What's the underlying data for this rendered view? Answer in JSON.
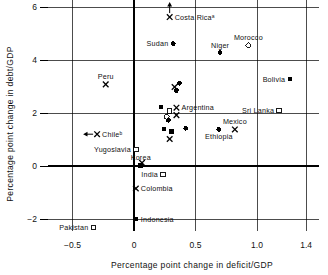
{
  "chart_data": {
    "type": "scatter",
    "title": "",
    "xlabel": "Percentage point change in deficit/GDP",
    "ylabel": "Percentage point change in debt/GDP",
    "xlim": [
      -0.7,
      1.5
    ],
    "ylim": [
      -2.45,
      6.35
    ],
    "xticks": [
      -0.5,
      0,
      0.5,
      1.0,
      1.4
    ],
    "xtick_labels": [
      "−0.5",
      "0",
      "0.5",
      "1.0",
      "1.4"
    ],
    "yticks": [
      -2,
      0,
      2,
      4,
      6
    ],
    "ytick_labels": [
      "−2",
      "0",
      "2",
      "4",
      "6"
    ],
    "grid": true,
    "legend": "none",
    "marker_types": {
      "filled-circle": "filled circle",
      "open-circle": "open circle",
      "filled-square": "filled square",
      "open-square": "open square",
      "cross": "x cross"
    },
    "points": [
      {
        "label": "Costa Ricaᵃ",
        "x": 0.29,
        "y": 5.62,
        "marker": "cross",
        "label_pos": "right",
        "arrow": "up"
      },
      {
        "label": "Sudan",
        "x": 0.32,
        "y": 4.62,
        "marker": "filled-circle",
        "label_pos": "left"
      },
      {
        "label": "Niger",
        "x": 0.7,
        "y": 4.28,
        "marker": "filled-circle",
        "label_pos": "above"
      },
      {
        "label": "Morocco",
        "x": 0.93,
        "y": 4.55,
        "marker": "open-circle",
        "label_pos": "above"
      },
      {
        "label": "Peru",
        "x": -0.23,
        "y": 3.08,
        "marker": "cross",
        "label_pos": "above"
      },
      {
        "label": "Bolivia",
        "x": 1.27,
        "y": 3.28,
        "marker": "filled-circle",
        "label_pos": "left"
      },
      {
        "label": "",
        "x": 0.37,
        "y": 3.12,
        "marker": "filled-circle",
        "label_pos": "none"
      },
      {
        "label": "",
        "x": 0.33,
        "y": 2.98,
        "marker": "cross",
        "label_pos": "none"
      },
      {
        "label": "",
        "x": 0.345,
        "y": 2.85,
        "marker": "filled-circle",
        "label_pos": "none"
      },
      {
        "label": "Argentina",
        "x": 0.345,
        "y": 2.2,
        "marker": "cross",
        "label_pos": "right"
      },
      {
        "label": "Sri Lanka",
        "x": 1.18,
        "y": 2.1,
        "marker": "open-square",
        "label_pos": "left"
      },
      {
        "label": "",
        "x": 0.22,
        "y": 2.22,
        "marker": "filled-square",
        "label_pos": "none"
      },
      {
        "label": "",
        "x": 0.29,
        "y": 2.08,
        "marker": "open-square",
        "label_pos": "none"
      },
      {
        "label": "",
        "x": 0.345,
        "y": 1.92,
        "marker": "cross",
        "label_pos": "none"
      },
      {
        "label": "",
        "x": 0.265,
        "y": 1.86,
        "marker": "open-circle",
        "label_pos": "none"
      },
      {
        "label": "",
        "x": 0.28,
        "y": 1.72,
        "marker": "filled-circle",
        "label_pos": "none"
      },
      {
        "label": "Mexico",
        "x": 0.82,
        "y": 1.38,
        "marker": "cross",
        "label_pos": "above"
      },
      {
        "label": "Ethiopia",
        "x": 0.69,
        "y": 1.38,
        "marker": "filled-circle",
        "label_pos": "below"
      },
      {
        "label": "",
        "x": 0.245,
        "y": 1.4,
        "marker": "filled-square",
        "label_pos": "none"
      },
      {
        "label": "",
        "x": 0.42,
        "y": 1.42,
        "marker": "filled-circle",
        "label_pos": "none"
      },
      {
        "label": "",
        "x": 0.305,
        "y": 1.3,
        "marker": "filled-square",
        "label_pos": "none"
      },
      {
        "label": "",
        "x": 0.29,
        "y": 1.02,
        "marker": "cross",
        "label_pos": "none"
      },
      {
        "label": "Chileᵇ",
        "x": -0.3,
        "y": 1.2,
        "marker": "cross",
        "label_pos": "right",
        "arrow": "left"
      },
      {
        "label": "Yugoslavia",
        "x": 0.015,
        "y": 0.62,
        "marker": "open-square",
        "label_pos": "left"
      },
      {
        "label": "Korea",
        "x": 0.055,
        "y": 0.02,
        "marker": "filled-square",
        "label_pos": "above"
      },
      {
        "label": "",
        "x": 0.065,
        "y": 0.12,
        "marker": "cross",
        "label_pos": "none"
      },
      {
        "label": "India",
        "x": 0.235,
        "y": -0.32,
        "marker": "open-square",
        "label_pos": "left"
      },
      {
        "label": "Colombia",
        "x": 0.015,
        "y": -0.85,
        "marker": "cross",
        "label_pos": "right"
      },
      {
        "label": "Indonesia",
        "x": 0.015,
        "y": -2.0,
        "marker": "filled-square",
        "label_pos": "right"
      },
      {
        "label": "Pakistan",
        "x": -0.33,
        "y": -2.32,
        "marker": "open-square",
        "label_pos": "left"
      }
    ]
  }
}
